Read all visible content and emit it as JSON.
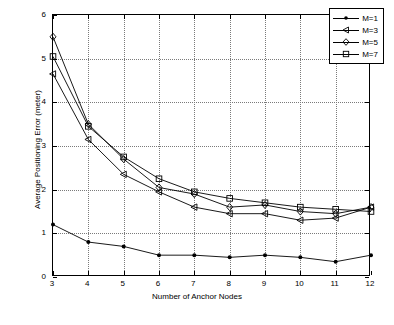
{
  "chart_data": {
    "type": "line",
    "title": "",
    "xlabel": "Number of Anchor Nodes",
    "ylabel": "Average Positioning Error (meter)",
    "xlim": [
      3,
      12
    ],
    "ylim": [
      0,
      6
    ],
    "xticks": [
      3,
      4,
      5,
      6,
      7,
      8,
      9,
      10,
      11,
      12
    ],
    "yticks": [
      0,
      1,
      2,
      3,
      4,
      5,
      6
    ],
    "grid": true,
    "legend_position": "top-right",
    "x": [
      3,
      4,
      5,
      6,
      7,
      8,
      9,
      10,
      11,
      12
    ],
    "series": [
      {
        "name": "M=1",
        "marker": "dot",
        "values": [
          1.2,
          0.8,
          0.7,
          0.5,
          0.5,
          0.45,
          0.5,
          0.45,
          0.35,
          0.5
        ]
      },
      {
        "name": "M=3",
        "marker": "triangle-left",
        "values": [
          4.65,
          3.15,
          2.35,
          1.95,
          1.6,
          1.45,
          1.45,
          1.3,
          1.35,
          1.6
        ]
      },
      {
        "name": "M=5",
        "marker": "diamond",
        "values": [
          5.5,
          3.5,
          2.7,
          2.05,
          1.9,
          1.6,
          1.65,
          1.5,
          1.45,
          1.6
        ]
      },
      {
        "name": "M=7",
        "marker": "square",
        "values": [
          5.05,
          3.45,
          2.75,
          2.25,
          1.95,
          1.8,
          1.7,
          1.6,
          1.55,
          1.5
        ]
      }
    ]
  },
  "legend": {
    "items": [
      {
        "label": "M=1"
      },
      {
        "label": "M=3"
      },
      {
        "label": "M=5"
      },
      {
        "label": "M=7"
      }
    ]
  },
  "colors": {
    "line": "#000000",
    "grid": "#7a7a7a",
    "background": "#ffffff"
  }
}
